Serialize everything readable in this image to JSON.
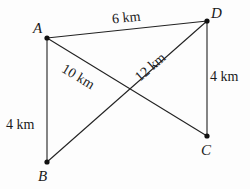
{
  "diagram": {
    "points": [
      {
        "name": "A",
        "x": 47,
        "y": 38
      },
      {
        "name": "D",
        "x": 207,
        "y": 21
      },
      {
        "name": "C",
        "x": 207,
        "y": 136
      },
      {
        "name": "B",
        "x": 47,
        "y": 162
      }
    ],
    "edges": [
      {
        "from": "A",
        "to": "D",
        "label": "6 km"
      },
      {
        "from": "A",
        "to": "C",
        "label": "10 km"
      },
      {
        "from": "B",
        "to": "D",
        "label": "12 km"
      },
      {
        "from": "A",
        "to": "B",
        "label": "4 km"
      },
      {
        "from": "D",
        "to": "C",
        "label": "4 km"
      }
    ],
    "colors": {
      "line": "#222222",
      "point": "#111111"
    }
  }
}
